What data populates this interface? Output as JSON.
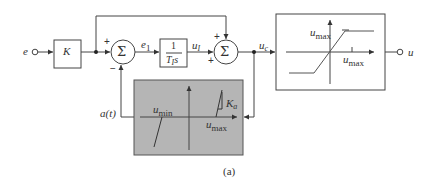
{
  "diagram": {
    "input": {
      "label": "e"
    },
    "gain_block": {
      "label": "K"
    },
    "sum1": {
      "symbol": "Σ",
      "sign_top": "+",
      "sign_bottom": "−"
    },
    "signal_e1": {
      "base": "e",
      "sub": "1"
    },
    "integrator": {
      "numerator": "1",
      "denominator_base": "T",
      "denominator_sub": "I",
      "denominator_var": "s"
    },
    "signal_uI": {
      "base": "u",
      "sub": "I"
    },
    "sum2": {
      "symbol": "Σ",
      "sign_top": "+",
      "sign_bottom": "+"
    },
    "signal_uc": {
      "base": "u",
      "sub": "c"
    },
    "saturation_block": {
      "ylabel_base": "u",
      "ylabel_sub": "max",
      "xlabel_base": "u",
      "xlabel_sub": "max"
    },
    "output": {
      "label": "u"
    },
    "antiwindup_block": {
      "umin_base": "u",
      "umin_sub": "min",
      "umax_base": "u",
      "umax_sub": "max",
      "slope_base": "K",
      "slope_sub": "a",
      "fill_color": "#b5b5b5"
    },
    "signal_at": {
      "label": "a(t)"
    },
    "caption": "(a)"
  }
}
